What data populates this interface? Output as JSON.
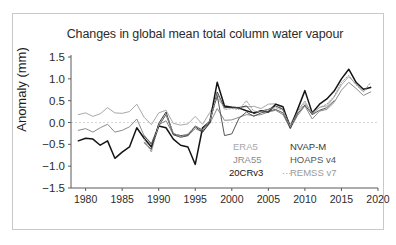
{
  "figure": {
    "title": "Changes in global mean total column water vapour"
  },
  "axes": {
    "ylabel": "Anomaly (mm)",
    "xlabel": "",
    "yticks": [
      "1.5",
      "1.0",
      "0.5",
      "0.0",
      "-0.5",
      "-1.0",
      "-1.5"
    ],
    "xticks": [
      "1980",
      "1985",
      "1990",
      "1995",
      "2000",
      "2005",
      "2010",
      "2015",
      "2020"
    ]
  },
  "legend": {
    "entries": [
      {
        "label": "ERA5",
        "color": "#a8a8a8",
        "style": "solid"
      },
      {
        "label": "JRA55",
        "color": "#8c8c8c",
        "style": "solid"
      },
      {
        "label": "20CRv3",
        "color": "#141414",
        "style": "solid"
      },
      {
        "label": "NVAP-M",
        "color": "#3a3a3a",
        "style": "solid"
      },
      {
        "label": "HOAPS v4",
        "color": "#555555",
        "style": "solid"
      },
      {
        "label": "REMSS v7",
        "color": "#9a9a9a",
        "style": "dotted",
        "marker": "···"
      }
    ]
  },
  "chart_data": {
    "type": "line",
    "title": "Changes in global mean total column water vapour",
    "xlabel": "",
    "ylabel": "Anomaly (mm)",
    "xlim": [
      1978,
      2020
    ],
    "ylim": [
      -1.5,
      1.5
    ],
    "grid": false,
    "zero_reference_line": 0.0,
    "legend_position": "lower-right-inside",
    "series": [
      {
        "name": "ERA5",
        "color": "#a8a8a8",
        "style": "solid",
        "x": [
          1979,
          1980,
          1981,
          1982,
          1983,
          1984,
          1985,
          1986,
          1987,
          1988,
          1989,
          1990,
          1991,
          1992,
          1993,
          1994,
          1995,
          1996,
          1997,
          1998,
          1999,
          2000,
          2001,
          2002,
          2003,
          2004,
          2005,
          2006,
          2007,
          2008,
          2009,
          2010,
          2011,
          2012,
          2013,
          2014,
          2015,
          2016,
          2017,
          2018,
          2019
        ],
        "values": [
          0.18,
          0.22,
          0.14,
          0.2,
          0.34,
          0.22,
          0.21,
          0.25,
          0.42,
          0.12,
          -0.05,
          0.22,
          0.28,
          -0.02,
          -0.06,
          -0.03,
          0.14,
          -0.04,
          0.23,
          0.55,
          0.36,
          0.34,
          0.35,
          0.36,
          0.37,
          0.32,
          0.42,
          0.43,
          0.3,
          -0.04,
          0.27,
          0.49,
          0.18,
          0.35,
          0.38,
          0.58,
          0.86,
          1.05,
          0.88,
          0.72,
          0.82
        ]
      },
      {
        "name": "JRA55",
        "color": "#8c8c8c",
        "style": "solid",
        "x": [
          1979,
          1980,
          1981,
          1982,
          1983,
          1984,
          1985,
          1986,
          1987,
          1988,
          1989,
          1990,
          1991,
          1992,
          1993,
          1994,
          1995,
          1996,
          1997,
          1998,
          1999,
          2000,
          2001,
          2002,
          2003,
          2004,
          2005,
          2006,
          2007,
          2008,
          2009,
          2010,
          2011,
          2012,
          2013,
          2014,
          2015,
          2016,
          2017,
          2018,
          2019
        ],
        "values": [
          -0.18,
          -0.14,
          -0.22,
          -0.12,
          -0.04,
          -0.22,
          -0.18,
          -0.1,
          0.08,
          -0.3,
          -0.48,
          -0.05,
          0.04,
          -0.28,
          -0.32,
          -0.3,
          -0.14,
          -0.22,
          -0.02,
          0.32,
          0.05,
          0.06,
          0.12,
          0.18,
          0.16,
          0.18,
          0.24,
          0.28,
          0.18,
          -0.14,
          0.16,
          0.38,
          0.08,
          0.26,
          0.3,
          0.46,
          0.74,
          0.92,
          0.78,
          0.62,
          0.7
        ]
      },
      {
        "name": "20CRv3",
        "color": "#141414",
        "style": "solid",
        "x": [
          1979,
          1980,
          1981,
          1982,
          1983,
          1984,
          1985,
          1986,
          1987,
          1988,
          1989,
          1990,
          1991,
          1992,
          1993,
          1994,
          1995,
          1996,
          1997,
          1998,
          1999,
          2000,
          2001,
          2002,
          2003,
          2004,
          2005,
          2006,
          2007,
          2008,
          2009,
          2010,
          2011,
          2012,
          2013,
          2014,
          2015,
          2016,
          2017,
          2018,
          2019
        ],
        "values": [
          -0.42,
          -0.36,
          -0.38,
          -0.52,
          -0.42,
          -0.82,
          -0.68,
          -0.56,
          -0.12,
          -0.36,
          -0.56,
          -0.08,
          -0.12,
          -0.38,
          -0.52,
          -0.56,
          -0.96,
          -0.12,
          0.02,
          0.92,
          0.38,
          0.35,
          0.33,
          0.27,
          0.22,
          0.27,
          0.24,
          0.42,
          0.36,
          -0.12,
          0.3,
          0.73,
          0.22,
          0.42,
          0.54,
          0.72,
          1.0,
          1.22,
          0.92,
          0.76,
          0.8
        ]
      },
      {
        "name": "NVAP-M",
        "color": "#3a3a3a",
        "style": "solid",
        "x": [
          1988,
          1989,
          1990,
          1991,
          1992,
          1993,
          1994,
          1995,
          1996,
          1997,
          1998,
          1999,
          2000,
          2001,
          2002,
          2003,
          2004,
          2005,
          2006,
          2007,
          2008,
          2009
        ],
        "values": [
          -0.46,
          -0.62,
          -0.02,
          0.24,
          -0.26,
          -0.3,
          -0.28,
          -0.1,
          -0.22,
          0.0,
          0.7,
          0.34,
          0.35,
          0.34,
          0.38,
          0.2,
          0.26,
          0.3,
          0.38,
          0.3,
          -0.1,
          0.22
        ]
      },
      {
        "name": "HOAPS v4",
        "color": "#555555",
        "style": "solid",
        "x": [
          1988,
          1989,
          1990,
          1991,
          1992,
          1993,
          1994,
          1995,
          1996,
          1997,
          1998,
          1999,
          2000,
          2001,
          2002,
          2003,
          2004,
          2005,
          2006,
          2007,
          2008,
          2009,
          2010,
          2011,
          2012,
          2013,
          2014
        ],
        "values": [
          -0.3,
          -0.5,
          -0.08,
          0.18,
          -0.28,
          -0.34,
          -0.3,
          -0.08,
          -0.18,
          0.04,
          0.62,
          -0.3,
          -0.26,
          0.1,
          0.24,
          0.14,
          0.22,
          0.26,
          0.3,
          0.22,
          -0.12,
          0.2,
          0.4,
          0.18,
          0.28,
          0.34,
          0.5
        ]
      },
      {
        "name": "REMSS v7",
        "color": "#9a9a9a",
        "style": "dotted",
        "x": [
          1988,
          1989,
          1990,
          1991,
          1992,
          1993,
          1994,
          1995,
          1996,
          1997,
          1998,
          1999,
          2000,
          2001,
          2002,
          2003,
          2004,
          2005,
          2006,
          2007,
          2008,
          2009,
          2010,
          2011,
          2012,
          2013,
          2014,
          2015,
          2016,
          2017,
          2018,
          2019
        ],
        "values": [
          -0.38,
          -0.68,
          -0.06,
          0.2,
          -0.24,
          -0.32,
          -0.26,
          -0.08,
          -0.16,
          0.04,
          0.66,
          0.3,
          0.32,
          0.3,
          0.5,
          0.26,
          0.24,
          0.3,
          0.34,
          0.28,
          -0.1,
          0.24,
          0.44,
          0.22,
          0.34,
          0.42,
          0.6,
          0.92,
          1.08,
          0.86,
          0.7,
          0.92
        ]
      }
    ]
  }
}
